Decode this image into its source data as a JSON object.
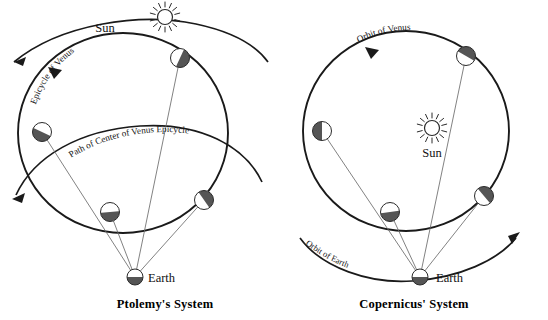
{
  "figure": {
    "title_hidden": "",
    "background_color": "#ffffff",
    "ink_color": "#1a1a1a",
    "shadow_color": "#555555",
    "sight_line_color": "#6b6b6b"
  },
  "panels": [
    {
      "id": "ptolemy",
      "caption": "Ptolemy's  System",
      "caption_x": 165,
      "caption_y": 308,
      "center_body": {
        "name": "Earth",
        "label": "Earth",
        "label_x": 148,
        "label_y": 281,
        "cx": 135,
        "cy": 277,
        "r": 8,
        "phase": "bottom-dark"
      },
      "sun": {
        "label": "Sun",
        "label_x": 105,
        "label_y": 32,
        "cx": 165,
        "cy": 17,
        "r": 7.5,
        "rays": 14
      },
      "curve_labels": [
        {
          "text": "Epicycle of Venus",
          "id": "epicycle-of-venus-label"
        },
        {
          "text": "Path of Center of Venus  Epicycle",
          "id": "path-of-center-label"
        }
      ],
      "venus_positions": [
        {
          "cx": 180,
          "cy": 58,
          "r": 9.5,
          "phase": "upper-right-dark",
          "angle": 40
        },
        {
          "cx": 42,
          "cy": 132,
          "r": 9.5,
          "phase": "lower-left-dark",
          "angle": 200
        },
        {
          "cx": 110,
          "cy": 212,
          "r": 9.5,
          "phase": "bottom-dark",
          "angle": 265
        },
        {
          "cx": 204,
          "cy": 200,
          "r": 9.5,
          "phase": "lower-right-dark",
          "angle": 320
        }
      ]
    },
    {
      "id": "copernicus",
      "caption": "Copernicus' System",
      "caption_x": 414,
      "caption_y": 308,
      "center_body": {
        "name": "Sun",
        "label": "Sun",
        "label_x": 432,
        "label_y": 156,
        "cx": 432,
        "cy": 128,
        "r": 7.5,
        "rays": 14
      },
      "observer": {
        "name": "Earth",
        "label": "Earth",
        "label_x": 434,
        "label_y": 281,
        "cx": 420,
        "cy": 277,
        "r": 8,
        "phase": "bottom-dark"
      },
      "curve_labels": [
        {
          "text": "Orbit of Venus",
          "id": "orbit-of-venus-label"
        },
        {
          "text": "Orbit of Earth",
          "id": "orbit-of-earth-label"
        }
      ],
      "venus_positions": [
        {
          "cx": 466,
          "cy": 56,
          "r": 9.5,
          "phase": "upper-right-dark",
          "angle": 55
        },
        {
          "cx": 322,
          "cy": 131,
          "r": 9.5,
          "phase": "left-dark",
          "angle": 185
        },
        {
          "cx": 390,
          "cy": 212,
          "r": 9.5,
          "phase": "bottom-dark",
          "angle": 265
        },
        {
          "cx": 484,
          "cy": 196,
          "r": 9.5,
          "phase": "lower-right-dark",
          "angle": 325
        }
      ]
    }
  ]
}
